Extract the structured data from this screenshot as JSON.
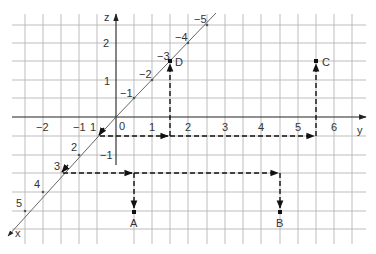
{
  "diagram": {
    "axes": {
      "z": {
        "label": "z",
        "ticks": [
          "2",
          "1",
          "-1"
        ]
      },
      "y": {
        "label": "y",
        "ticks": [
          "-2",
          "-1",
          "0",
          "1",
          "2",
          "3",
          "4",
          "5",
          "6"
        ]
      },
      "x": {
        "label": "x",
        "ticks": [
          "1",
          "2",
          "3",
          "4",
          "5",
          "-1",
          "-2",
          "-3",
          "-4",
          "-5"
        ]
      }
    },
    "labels": {
      "z_axis": "z",
      "y_axis": "y",
      "x_axis": "x",
      "origin": "0",
      "y_neg2": "−2",
      "y_neg1": "−1",
      "y_1": "1",
      "y_2": "2",
      "y_3": "3",
      "y_4": "4",
      "y_5": "5",
      "y_6": "6",
      "z_2": "2",
      "z_1": "1",
      "z_neg1": "−1",
      "x_1": "1",
      "x_2": "2",
      "x_3": "3",
      "x_4": "4",
      "x_5": "5",
      "x_neg1": "−1",
      "x_neg2": "−2",
      "x_neg3": "−3",
      "x_neg4": "−4",
      "x_neg5": "−5"
    },
    "points": {
      "A": {
        "label": "A"
      },
      "B": {
        "label": "B"
      },
      "C": {
        "label": "C"
      },
      "D": {
        "label": "D"
      }
    },
    "colors": {
      "grid": "#b5b5b5",
      "axis": "#222222",
      "dashed_path": "#111111",
      "text": "#333333"
    }
  }
}
